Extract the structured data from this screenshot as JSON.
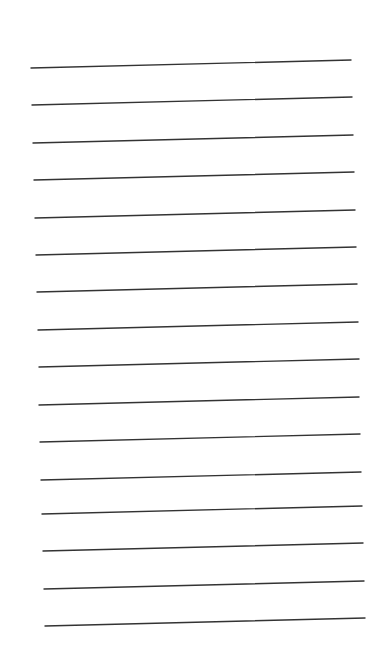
{
  "page": {
    "background": "#ffffff",
    "line_color": "#333333",
    "line_count": 16,
    "lines": [
      {
        "x1": 31,
        "y1": 68,
        "x2": 351,
        "y2": 60
      },
      {
        "x1": 32,
        "y1": 105,
        "x2": 352,
        "y2": 97
      },
      {
        "x1": 33,
        "y1": 143,
        "x2": 353,
        "y2": 135
      },
      {
        "x1": 34,
        "y1": 180,
        "x2": 354,
        "y2": 172
      },
      {
        "x1": 35,
        "y1": 218,
        "x2": 355,
        "y2": 210
      },
      {
        "x1": 36,
        "y1": 255,
        "x2": 356,
        "y2": 247
      },
      {
        "x1": 37,
        "y1": 292,
        "x2": 357,
        "y2": 284
      },
      {
        "x1": 38,
        "y1": 330,
        "x2": 358,
        "y2": 322
      },
      {
        "x1": 39,
        "y1": 367,
        "x2": 359,
        "y2": 359
      },
      {
        "x1": 39,
        "y1": 405,
        "x2": 359,
        "y2": 397
      },
      {
        "x1": 40,
        "y1": 442,
        "x2": 360,
        "y2": 434
      },
      {
        "x1": 41,
        "y1": 480,
        "x2": 361,
        "y2": 472
      },
      {
        "x1": 42,
        "y1": 514,
        "x2": 362,
        "y2": 506
      },
      {
        "x1": 43,
        "y1": 551,
        "x2": 363,
        "y2": 543
      },
      {
        "x1": 44,
        "y1": 589,
        "x2": 364,
        "y2": 581
      },
      {
        "x1": 45,
        "y1": 626,
        "x2": 365,
        "y2": 618
      }
    ]
  }
}
